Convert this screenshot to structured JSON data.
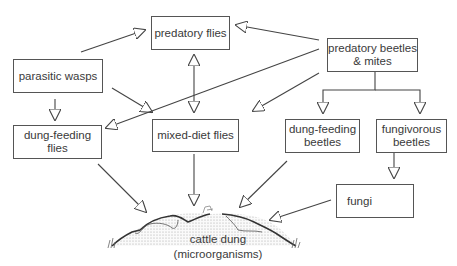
{
  "nodes": {
    "predatory_flies": "predatory flies",
    "parasitic_wasps": "parasitic wasps",
    "predatory_beetles_mites_line1": "predatory beetles",
    "predatory_beetles_mites_line2": "& mites",
    "dung_feeding_flies": "dung-feeding flies",
    "mixed_diet_flies": "mixed-diet flies",
    "dung_feeding_beetles_line1": "dung-feeding",
    "dung_feeding_beetles_line2": "beetles",
    "fungivorous_beetles_line1": "fungivorous",
    "fungivorous_beetles_line2": "beetles",
    "fungi": "fungi",
    "cattle_dung_line1": "cattle dung",
    "cattle_dung_line2": "(microorganisms)"
  },
  "edges": [
    {
      "from": "parasitic wasps",
      "to": "predatory flies"
    },
    {
      "from": "parasitic wasps",
      "to": "dung-feeding flies"
    },
    {
      "from": "parasitic wasps",
      "to": "mixed-diet flies"
    },
    {
      "from": "predatory flies",
      "to": "mixed-diet flies",
      "bidirectional": true
    },
    {
      "from": "predatory beetles & mites",
      "to": "predatory flies"
    },
    {
      "from": "predatory beetles & mites",
      "to": "dung-feeding flies"
    },
    {
      "from": "predatory beetles & mites",
      "to": "mixed-diet flies"
    },
    {
      "from": "predatory beetles & mites",
      "to": "dung-feeding beetles"
    },
    {
      "from": "predatory beetles & mites",
      "to": "fungivorous beetles"
    },
    {
      "from": "fungivorous beetles",
      "to": "fungi"
    },
    {
      "from": "dung-feeding flies",
      "to": "cattle dung"
    },
    {
      "from": "mixed-diet flies",
      "to": "cattle dung"
    },
    {
      "from": "dung-feeding beetles",
      "to": "cattle dung"
    },
    {
      "from": "fungi",
      "to": "cattle dung"
    }
  ],
  "icons": {
    "fungi": "mushroom-sketch-icon",
    "dung": "dung-pat-sketch"
  }
}
